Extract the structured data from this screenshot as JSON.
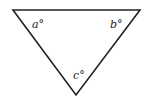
{
  "diagram": {
    "shape": "inverted-triangle",
    "vertices": {
      "top_left": [
        13,
        10
      ],
      "top_right": [
        140,
        10
      ],
      "bottom": [
        76,
        95
      ]
    },
    "angle_labels": {
      "a": "a°",
      "b": "b°",
      "c": "c°"
    },
    "stroke_color": "#222222"
  }
}
